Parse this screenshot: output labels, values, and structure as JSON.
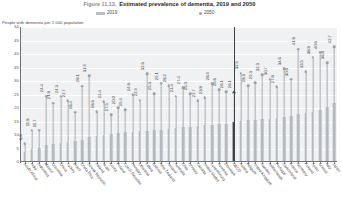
{
  "figure": {
    "number": "Figure 11.13.",
    "title": "Estimated prevalence of dementia, 2019 and 2050"
  },
  "legend": {
    "series_2019": "2019",
    "series_2050": "2050"
  },
  "axis": {
    "y_title": "People with dementia per 1 000 population"
  },
  "chart_data": {
    "type": "bar",
    "title": "Estimated prevalence of dementia, 2019 and 2050",
    "xlabel": "",
    "ylabel": "People with dementia per 1 000 population",
    "ylim": [
      0,
      50
    ],
    "yticks": [
      0,
      5,
      10,
      15,
      20,
      25,
      30,
      35,
      40,
      45,
      50
    ],
    "grid": true,
    "legend_position": "top",
    "highlight_index": 29,
    "categories": [
      "South Africa",
      "India",
      "Indonesia",
      "Mexico",
      "Colombia",
      "China",
      "Turkey",
      "Brazil",
      "Costa Rica",
      "Slovak Republic",
      "Ireland",
      "Israel",
      "Korea",
      "Poland",
      "Czech Republic",
      "Hungary",
      "Lithuania",
      "Latvia",
      "Estonia",
      "New Zealand",
      "Iceland",
      "Australia",
      "Chile",
      "Norway",
      "Canada",
      "United States",
      "Luxembourg",
      "Slovenia",
      "Denmark",
      "OECD",
      "Austria",
      "Belgium",
      "United Kingdom",
      "Sweden",
      "Netherlands",
      "Portugal",
      "Switzerland",
      "France",
      "Germany",
      "Finland",
      "Spain",
      "Greece",
      "Italy",
      "Japan"
    ],
    "series": [
      {
        "name": "2019",
        "values": [
          3.8,
          5.0,
          5.1,
          6.2,
          6.5,
          7.1,
          7.3,
          7.6,
          8.0,
          9.2,
          9.6,
          10.0,
          10.4,
          10.7,
          11.0,
          11.2,
          11.4,
          11.6,
          11.8,
          12.0,
          12.3,
          12.6,
          12.9,
          13.1,
          13.4,
          13.6,
          13.8,
          14.0,
          14.2,
          14.8,
          15.1,
          15.4,
          15.6,
          15.8,
          16.0,
          16.4,
          16.8,
          17.2,
          17.6,
          18.0,
          18.6,
          19.4,
          20.4,
          22.0
        ]
      },
      {
        "name": "2050",
        "values": [
          6.8,
          11.8,
          11.7,
          24.4,
          21.8,
          24.3,
          22.7,
          18.4,
          28.1,
          31.9,
          18.6,
          22.4,
          17.5,
          20.0,
          19.4,
          24.8,
          22.9,
          32.6,
          25.3,
          29.1,
          28.2,
          24.4,
          27.4,
          25.3,
          22.7,
          23.8,
          28.9,
          26.8,
          26.1,
          26.1,
          32.9,
          28.3,
          29.3,
          32.3,
          30.7,
          27.8,
          34.6,
          30.6,
          41.8,
          33.5,
          38.8,
          40.6,
          36.8,
          42.7
        ]
      }
    ],
    "data_labels_2050": [
      "6.8",
      "11.8",
      "11.7",
      "24.4",
      "21.8",
      "24.3",
      "22.7",
      "18.4",
      "28.1",
      "31.9",
      "18.6",
      "22.4",
      "17.5",
      "20.0",
      "19.4",
      "24.8",
      "22.9",
      "32.6",
      "25.3",
      "29.1",
      "28.2",
      "24.4",
      "27.4",
      "25.3",
      "22.7",
      "23.8",
      "28.9",
      "26.8",
      "26.1",
      "26.1",
      "32.9",
      "28.3",
      "29.3",
      "32.3",
      "30.7",
      "27.8",
      "34.6",
      "30.6",
      "41.8",
      "33.5",
      "38.8",
      "40.6",
      "36.8",
      "42.7"
    ]
  },
  "colors": {
    "bar_2019": "#b4b9bf",
    "marker_2050": "#9aa1a8",
    "highlight": "#3e4247",
    "plot_background": "#f0f1f2",
    "gridline": "#ffffff"
  }
}
